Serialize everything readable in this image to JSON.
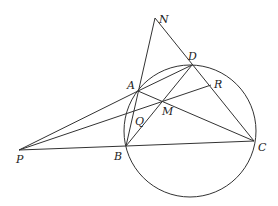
{
  "diagram": {
    "type": "geometry",
    "circle": {
      "cx": 190,
      "cy": 131,
      "r": 66
    },
    "points": {
      "N": {
        "x": 155,
        "y": 18,
        "label": "N",
        "lx": 159,
        "ly": 23
      },
      "D": {
        "x": 192,
        "y": 65,
        "label": "D",
        "lx": 188,
        "ly": 60
      },
      "A": {
        "x": 138,
        "y": 91,
        "label": "A",
        "lx": 127,
        "ly": 89
      },
      "R": {
        "x": 211,
        "y": 85,
        "label": "R",
        "lx": 214,
        "ly": 88
      },
      "M": {
        "x": 164,
        "y": 101,
        "label": "M",
        "lx": 162,
        "ly": 115
      },
      "Q": {
        "x": 148,
        "y": 121,
        "label": "Q",
        "lx": 135,
        "ly": 125
      },
      "B": {
        "x": 126,
        "y": 146,
        "label": "B",
        "lx": 114,
        "ly": 160
      },
      "C": {
        "x": 254,
        "y": 141,
        "label": "C",
        "lx": 258,
        "ly": 151
      },
      "P": {
        "x": 19,
        "y": 150,
        "label": "P",
        "lx": 16,
        "ly": 163
      }
    },
    "segments": [
      [
        "N",
        "B"
      ],
      [
        "N",
        "C"
      ],
      [
        "A",
        "D"
      ],
      [
        "A",
        "C"
      ],
      [
        "B",
        "D"
      ],
      [
        "B",
        "C"
      ],
      [
        "P",
        "A"
      ],
      [
        "P",
        "R"
      ],
      [
        "P",
        "B"
      ]
    ]
  }
}
